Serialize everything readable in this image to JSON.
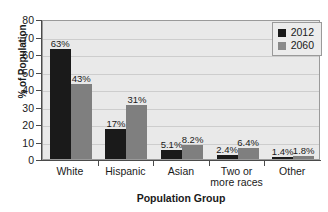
{
  "chart_data": {
    "type": "bar",
    "title": "",
    "xlabel": "Population Group",
    "ylabel": "% of Population",
    "ylim": [
      0,
      80
    ],
    "yticks": [
      0,
      10,
      20,
      30,
      40,
      50,
      60,
      70,
      80
    ],
    "grid": true,
    "legend_position": "top-right",
    "categories": [
      "White",
      "Hispanic",
      "Asian",
      "Two or\nmore races",
      "Other"
    ],
    "category_lines": [
      [
        "White"
      ],
      [
        "Hispanic"
      ],
      [
        "Asian"
      ],
      [
        "Two or",
        "more races"
      ],
      [
        "Other"
      ]
    ],
    "series": [
      {
        "name": "2012",
        "color": "#1a1a1a",
        "values": [
          63,
          17,
          5.1,
          2.4,
          1.4
        ],
        "labels": [
          "63%",
          "17%",
          "5.1%",
          "2.4%",
          "1.4%"
        ]
      },
      {
        "name": "2060",
        "color": "#7f7f7f",
        "values": [
          43,
          31,
          8.2,
          6.4,
          1.8
        ],
        "labels": [
          "43%",
          "31%",
          "8.2%",
          "6.4%",
          "1.8%"
        ]
      }
    ]
  },
  "legend": {
    "entries": [
      {
        "label": "2012",
        "swatch": "black-square-swatch"
      },
      {
        "label": "2060",
        "swatch": "gray-square-swatch"
      }
    ]
  },
  "axes": {
    "y_tick_labels": [
      "80",
      "70",
      "60",
      "50",
      "40",
      "30",
      "20",
      "10",
      "0"
    ],
    "y_title": "% of Population",
    "x_title": "Population Group"
  }
}
